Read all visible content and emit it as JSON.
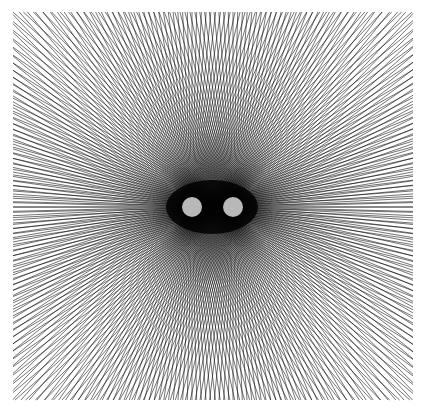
{
  "diagram": {
    "type": "two-source radial line field",
    "background": "#ffffff",
    "line_color": "#000000",
    "frame": {
      "x0": 13,
      "y0": 12,
      "x1": 413,
      "y1": 400
    },
    "sources": [
      {
        "name": "left-source",
        "cx": 192,
        "cy": 207,
        "r": 10,
        "fill": "#b8b8b8"
      },
      {
        "name": "right-source",
        "cx": 233,
        "cy": 207,
        "r": 10,
        "fill": "#b8b8b8"
      }
    ],
    "rays_per_source": 260,
    "line_width": 0.55,
    "core_ellipse": {
      "cx": 212,
      "cy": 207,
      "rx": 46,
      "ry": 27,
      "fill": "#000000"
    }
  },
  "caption": ""
}
